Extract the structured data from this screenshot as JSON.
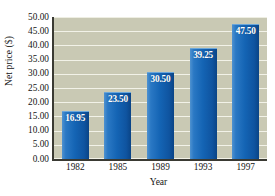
{
  "chart_data": {
    "type": "bar",
    "title": "",
    "subtitle": "",
    "xlabel": "Year",
    "ylabel": "Net price ($)",
    "categories": [
      "1982",
      "1985",
      "1989",
      "1993",
      "1997"
    ],
    "values": [
      16.95,
      23.5,
      30.5,
      39.25,
      47.5
    ],
    "value_labels": [
      "16.95",
      "23.50",
      "30.50",
      "39.25",
      "47.50"
    ],
    "ylim": [
      0,
      50
    ],
    "ytick_labels": [
      "50.00",
      "45.00",
      "40.00",
      "35.00",
      "30.00",
      "25.00",
      "20.00",
      "15.00",
      "10.00",
      "5.00",
      "0.00"
    ],
    "ytick_values": [
      50,
      45,
      40,
      35,
      30,
      25,
      20,
      15,
      10,
      5,
      0
    ],
    "grid": true,
    "grid_orientation": "horizontal",
    "legend": false,
    "legend_position": "none",
    "colors": {
      "bar": "#1464b4",
      "bar_highlight": "#4f92d0",
      "bar_shadow": "#0a4486",
      "plot_background": "#c9c9b4",
      "gridline": "#f2f2e8",
      "axis": "#3a3a33",
      "value_label_text": "#ffffff",
      "tick_text": "#141414",
      "figure_background": "#ffffff"
    }
  }
}
